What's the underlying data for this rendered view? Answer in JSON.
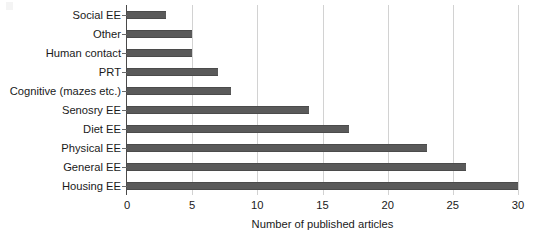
{
  "chart_data": {
    "type": "bar",
    "orientation": "horizontal",
    "title": "",
    "xlabel": "Number of published articles",
    "ylabel": "",
    "xlim": [
      0,
      30
    ],
    "xticks": [
      0,
      5,
      10,
      15,
      20,
      25,
      30
    ],
    "grid": "vertical",
    "legend": "none",
    "bar_color": "#5a5a5a",
    "gridline_color": "#d2d2d2",
    "axis_color": "#4a4a4a",
    "categories": [
      "Social EE",
      "Other",
      "Human contact",
      "PRT",
      "Cognitive (mazes etc.)",
      "Senosry EE",
      "Diet EE",
      "Physical EE",
      "General EE",
      "Housing EE"
    ],
    "values": [
      3,
      5,
      5,
      7,
      8,
      14,
      17,
      23,
      26,
      30
    ]
  }
}
